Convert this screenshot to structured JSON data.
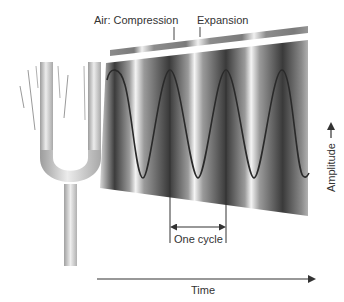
{
  "labels": {
    "air_compression": "Air: Compression",
    "expansion": "Expansion",
    "amplitude": "Amplitude",
    "one_cycle": "One cycle",
    "time": "Time"
  },
  "colors": {
    "background": "#ffffff",
    "wave_line": "#2a2a2a",
    "text": "#333333",
    "dark_band": "#3a3a3a",
    "light_band": "#f2f2f2",
    "fork_light": "#e6e6e6",
    "fork_dark": "#9a9a9a"
  },
  "wave": {
    "peaks_x": [
      115,
      170,
      226,
      282
    ],
    "troughs_x": [
      143,
      198,
      254
    ],
    "peak_y": 70,
    "trough_y": 178,
    "cycles_shown": 3.5
  }
}
